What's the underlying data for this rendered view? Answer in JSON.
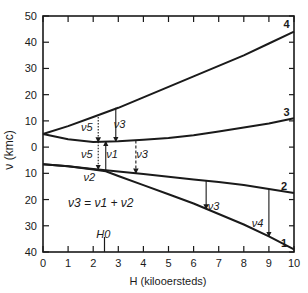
{
  "chart_data": {
    "type": "line",
    "title": "",
    "xlabel": "H (kilooersteds)",
    "ylabel": "ν (kmc)",
    "xlim": [
      0,
      10
    ],
    "ylim": [
      -40,
      50
    ],
    "x_ticks": [
      "0",
      "1",
      "2",
      "3",
      "4",
      "5",
      "6",
      "7",
      "8",
      "9",
      "10"
    ],
    "y_tick_labels": [
      {
        "value": 50,
        "label": "50"
      },
      {
        "value": 40,
        "label": "40"
      },
      {
        "value": 30,
        "label": "30"
      },
      {
        "value": 20,
        "label": "20"
      },
      {
        "value": 10,
        "label": "10"
      },
      {
        "value": 0,
        "label": "0"
      },
      {
        "value": -10,
        "label": "10"
      },
      {
        "value": -20,
        "label": "20"
      },
      {
        "value": -30,
        "label": "30"
      },
      {
        "value": -40,
        "label": "40"
      }
    ],
    "grid": false,
    "series": [
      {
        "name": "4",
        "x": [
          0,
          1,
          2,
          3,
          4,
          5,
          6,
          7,
          8,
          9,
          10
        ],
        "y": [
          5,
          8,
          11.5,
          15,
          19,
          23,
          27,
          31,
          35,
          39.5,
          44
        ]
      },
      {
        "name": "3",
        "x": [
          0,
          1,
          2,
          3,
          4,
          5,
          6,
          7,
          8,
          9,
          10
        ],
        "y": [
          5,
          3,
          2,
          2.2,
          2.8,
          3.5,
          4.5,
          6,
          7.5,
          9,
          11
        ]
      },
      {
        "name": "2",
        "x": [
          0,
          1,
          2,
          3,
          4,
          5,
          6,
          7,
          8,
          9,
          10
        ],
        "y": [
          -6.5,
          -7.3,
          -8.3,
          -9.3,
          -10.3,
          -11.3,
          -12.3,
          -13.3,
          -14.5,
          -16,
          -17.5
        ]
      },
      {
        "name": "1",
        "x": [
          0,
          1,
          2,
          2.5,
          3,
          4,
          5,
          6,
          7,
          8,
          9,
          10
        ],
        "y": [
          -6.5,
          -7.3,
          -8.5,
          -9.2,
          -11,
          -14.5,
          -18,
          -21.5,
          -25.5,
          -29.5,
          -34,
          -39
        ]
      }
    ],
    "curve_labels": [
      {
        "text": "4",
        "x": 9.7,
        "y": 47
      },
      {
        "text": "3",
        "x": 9.7,
        "y": 13.5
      },
      {
        "text": "2",
        "x": 9.6,
        "y": -15
      },
      {
        "text": "1",
        "x": 9.6,
        "y": -36.5
      }
    ],
    "annotations": [
      {
        "text": "ν5",
        "x": 1.75,
        "y": 7.5
      },
      {
        "text": "ν3",
        "x": 3.05,
        "y": 9
      },
      {
        "text": "ν5",
        "x": 1.75,
        "y": -2.5
      },
      {
        "text": "ν1",
        "x": 2.75,
        "y": -2.5
      },
      {
        "text": "ν3",
        "x": 3.95,
        "y": -2.5
      },
      {
        "text": "ν2",
        "x": 1.85,
        "y": -11.5
      },
      {
        "text": "ν3",
        "x": 6.8,
        "y": -22.5
      },
      {
        "text": "ν4",
        "x": 8.55,
        "y": -29
      },
      {
        "text": "ν3 = ν1 + ν2",
        "x": 1.0,
        "y": -21.5
      },
      {
        "text": "H0",
        "x": 2.4,
        "y": -33
      }
    ],
    "arrows": [
      {
        "x": 2.2,
        "y_from": 11.5,
        "y_to": 2,
        "style": "dotted",
        "label": "ν5"
      },
      {
        "x": 2.9,
        "y_from": 15,
        "y_to": 2.2,
        "style": "solid",
        "label": "ν3"
      },
      {
        "x": 2.2,
        "y_from": 2,
        "y_to": -8.4,
        "style": "dotted",
        "label": "ν5"
      },
      {
        "x": 2.5,
        "y_from": -9.2,
        "y_to": 2.1,
        "style": "solid",
        "label": "ν1"
      },
      {
        "x": 3.7,
        "y_from": 2.5,
        "y_to": -9.9,
        "style": "dashed",
        "label": "ν3"
      },
      {
        "x": 6.5,
        "y_from": -12.8,
        "y_to": -23.5,
        "style": "solid",
        "label": "ν3"
      },
      {
        "x": 9.0,
        "y_from": -16,
        "y_to": -34,
        "style": "solid",
        "label": "ν4"
      }
    ],
    "markers": [
      {
        "label": "H0",
        "x": 2.45
      }
    ]
  }
}
